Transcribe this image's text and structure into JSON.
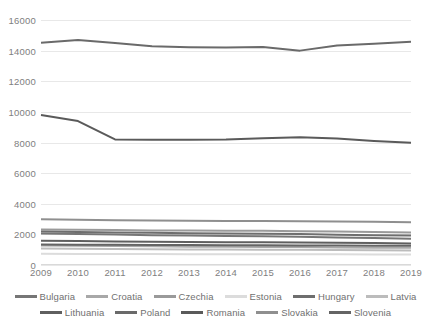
{
  "chart_data": {
    "type": "line",
    "title": "",
    "xlabel": "",
    "ylabel": "",
    "x": [
      2009,
      2010,
      2011,
      2012,
      2013,
      2014,
      2015,
      2016,
      2017,
      2018,
      2019
    ],
    "xtick_labels": [
      "2009",
      "2010",
      "2011",
      "2012",
      "2013",
      "2014",
      "2015",
      "2016",
      "2017",
      "2018",
      "2019"
    ],
    "ytick_labels": [
      "16000",
      "14000",
      "12000",
      "10000",
      "8000",
      "6000",
      "4000",
      "2000",
      "0"
    ],
    "ylim": [
      0,
      16000
    ],
    "ytick_step": 2000,
    "grid": true,
    "legend_position": "bottom",
    "series": [
      {
        "name": "Bulgaria",
        "color": "#767676",
        "values": [
          2050,
          2020,
          1990,
          1950,
          1930,
          1900,
          1870,
          1850,
          1800,
          1760,
          1720
        ]
      },
      {
        "name": "Croatia",
        "color": "#a8a8a8",
        "values": [
          1280,
          1260,
          1240,
          1220,
          1200,
          1190,
          1180,
          1170,
          1150,
          1130,
          1120
        ]
      },
      {
        "name": "Czechia",
        "color": "#9a9a9a",
        "values": [
          2320,
          2300,
          2280,
          2260,
          2250,
          2240,
          2230,
          2210,
          2180,
          2150,
          2120
        ]
      },
      {
        "name": "Estonia",
        "color": "#dcdcdc",
        "values": [
          730,
          725,
          720,
          715,
          710,
          705,
          700,
          700,
          695,
          690,
          685
        ]
      },
      {
        "name": "Hungary",
        "color": "#6e6e6e",
        "values": [
          2180,
          2150,
          2120,
          2100,
          2080,
          2060,
          2040,
          2020,
          1980,
          1950,
          1920
        ]
      },
      {
        "name": "Latvia",
        "color": "#bcbcbc",
        "values": [
          1080,
          1065,
          1050,
          1035,
          1020,
          1010,
          1000,
          990,
          975,
          960,
          950
        ]
      },
      {
        "name": "Lithuania",
        "color": "#5f5f5f",
        "values": [
          1580,
          1560,
          1540,
          1520,
          1500,
          1490,
          1480,
          1470,
          1450,
          1430,
          1410
        ]
      },
      {
        "name": "Poland",
        "color": "#6a6a6a",
        "values": [
          14520,
          14700,
          14500,
          14280,
          14220,
          14200,
          14240,
          14000,
          14340,
          14450,
          14580
        ]
      },
      {
        "name": "Romania",
        "color": "#5a5a5a",
        "values": [
          9800,
          9400,
          8200,
          8180,
          8180,
          8200,
          8280,
          8340,
          8260,
          8100,
          7980
        ]
      },
      {
        "name": "Slovakia",
        "color": "#8f8f8f",
        "values": [
          2980,
          2950,
          2920,
          2900,
          2890,
          2880,
          2870,
          2860,
          2840,
          2820,
          2800
        ]
      },
      {
        "name": "Slovenia",
        "color": "#646464",
        "values": [
          1340,
          1330,
          1320,
          1310,
          1300,
          1290,
          1285,
          1280,
          1270,
          1260,
          1250
        ]
      }
    ]
  },
  "legend": {
    "row1": [
      "Bulgaria",
      "Croatia",
      "Czechia",
      "Estonia",
      "Hungary",
      "Latvia"
    ],
    "row2": [
      "Lithuania",
      "Poland",
      "Romania",
      "Slovakia",
      "Slovenia"
    ]
  }
}
